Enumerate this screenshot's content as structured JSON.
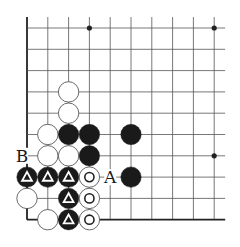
{
  "diagram": {
    "type": "go-board-fragment",
    "grid": {
      "cols": 10,
      "rows": 10,
      "origin_x": 27,
      "origin_y": 28,
      "spacing_x": 20.8,
      "spacing_y": 21.3,
      "top_extend": 11,
      "right_extend": 11,
      "edges": [
        "left",
        "bottom"
      ]
    },
    "colors": {
      "line": "#555555",
      "edge": "#222222",
      "black_stone": "#1a1a1a",
      "white_stone": "#ffffff",
      "white_stroke": "#444444",
      "mark_on_black": "#ffffff",
      "mark_on_white": "#222222"
    },
    "star_points": [
      {
        "col": 3,
        "row": 0
      },
      {
        "col": 9,
        "row": 0
      },
      {
        "col": 9,
        "row": 6
      }
    ],
    "stones": [
      {
        "col": 2,
        "row": 3,
        "color": "white",
        "mark": ""
      },
      {
        "col": 2,
        "row": 4,
        "color": "white",
        "mark": ""
      },
      {
        "col": 1,
        "row": 5,
        "color": "white",
        "mark": ""
      },
      {
        "col": 2,
        "row": 5,
        "color": "black",
        "mark": ""
      },
      {
        "col": 3,
        "row": 5,
        "color": "black",
        "mark": ""
      },
      {
        "col": 5,
        "row": 5,
        "color": "black",
        "mark": ""
      },
      {
        "col": 1,
        "row": 6,
        "color": "white",
        "mark": ""
      },
      {
        "col": 2,
        "row": 6,
        "color": "white",
        "mark": ""
      },
      {
        "col": 3,
        "row": 6,
        "color": "black",
        "mark": ""
      },
      {
        "col": 0,
        "row": 7,
        "color": "black",
        "mark": "triangle"
      },
      {
        "col": 1,
        "row": 7,
        "color": "black",
        "mark": "triangle"
      },
      {
        "col": 2,
        "row": 7,
        "color": "black",
        "mark": "triangle"
      },
      {
        "col": 3,
        "row": 7,
        "color": "white",
        "mark": "circle"
      },
      {
        "col": 5,
        "row": 7,
        "color": "black",
        "mark": ""
      },
      {
        "col": 0,
        "row": 8,
        "color": "white",
        "mark": ""
      },
      {
        "col": 2,
        "row": 8,
        "color": "black",
        "mark": "triangle"
      },
      {
        "col": 3,
        "row": 8,
        "color": "white",
        "mark": "circle"
      },
      {
        "col": 1,
        "row": 9,
        "color": "white",
        "mark": ""
      },
      {
        "col": 2,
        "row": 9,
        "color": "black",
        "mark": "triangle"
      },
      {
        "col": 3,
        "row": 9,
        "color": "white",
        "mark": "circle"
      }
    ],
    "labels": [
      {
        "col": 0,
        "row": 6,
        "text": "B",
        "dx": -5,
        "dy": 0
      },
      {
        "col": 4,
        "row": 7,
        "text": "A",
        "dx": 0,
        "dy": 0
      }
    ]
  }
}
